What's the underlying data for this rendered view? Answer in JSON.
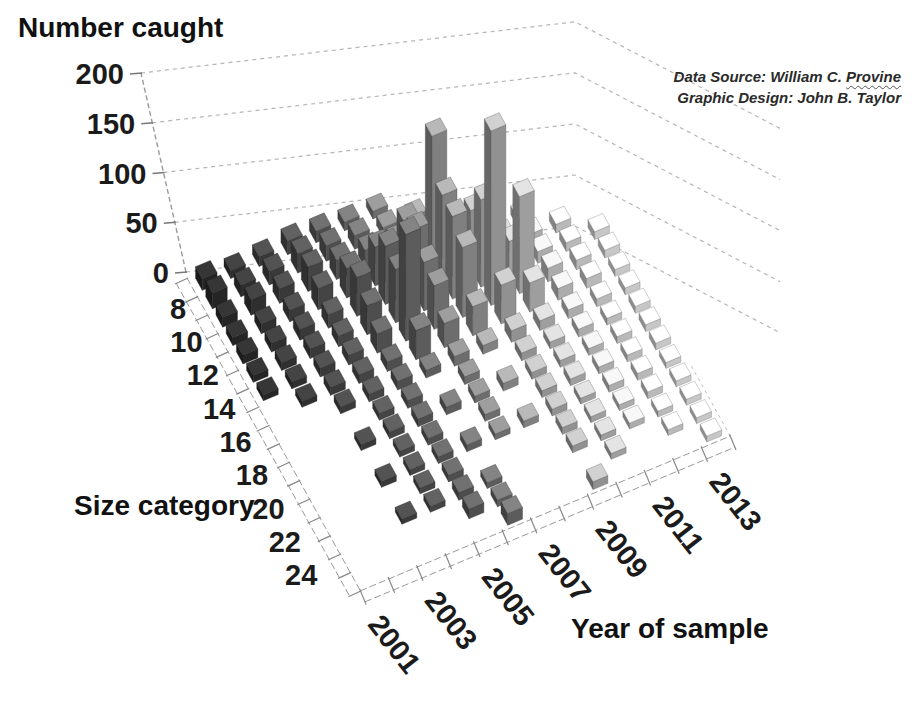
{
  "credits": {
    "data_source_prefix": "Data Source: William C. ",
    "data_source_name": "Provine",
    "graphic_design": "Graphic Design:  John B. Taylor"
  },
  "chart_data": {
    "type": "bar",
    "variant": "3d-column",
    "title": "",
    "value_axis": {
      "title": "Number caught",
      "min": 0,
      "max": 200,
      "tick_step": 50,
      "ticks": [
        0,
        50,
        100,
        150,
        200
      ]
    },
    "size_axis": {
      "title": "Size category",
      "categories": [
        8,
        9,
        10,
        11,
        12,
        13,
        14,
        15,
        16,
        17,
        18,
        19,
        20,
        21,
        22,
        23,
        24
      ],
      "labeled_ticks": [
        8,
        10,
        12,
        14,
        16,
        18,
        20,
        22,
        24
      ]
    },
    "year_axis": {
      "title": "Year of sample",
      "categories": [
        2001,
        2002,
        2003,
        2004,
        2005,
        2006,
        2007,
        2008,
        2009,
        2010,
        2011,
        2012,
        2013
      ],
      "labeled_ticks": [
        2001,
        2003,
        2005,
        2007,
        2009,
        2011,
        2013
      ]
    },
    "legend": "none",
    "grid": "dashed-backwall",
    "series": [
      {
        "size": 8,
        "values": [
          12,
          8,
          10,
          14,
          12,
          9,
          8,
          0,
          0,
          0,
          0,
          0,
          0
        ]
      },
      {
        "size": 9,
        "values": [
          16,
          12,
          14,
          20,
          16,
          14,
          10,
          9,
          0,
          0,
          0,
          0,
          0
        ]
      },
      {
        "size": 10,
        "values": [
          10,
          16,
          15,
          25,
          20,
          18,
          15,
          12,
          10,
          0,
          0,
          0,
          0
        ]
      },
      {
        "size": 11,
        "values": [
          8,
          10,
          12,
          22,
          30,
          40,
          55,
          130,
          28,
          12,
          9,
          0,
          0
        ]
      },
      {
        "size": 12,
        "values": [
          9,
          9,
          11,
          14,
          40,
          60,
          65,
          88,
          60,
          20,
          10,
          9,
          0
        ]
      },
      {
        "size": 13,
        "values": [
          7,
          8,
          10,
          11,
          30,
          55,
          50,
          85,
          90,
          35,
          12,
          9,
          8
        ]
      },
      {
        "size": 14,
        "values": [
          6,
          7,
          9,
          10,
          20,
          110,
          45,
          72,
          180,
          100,
          14,
          10,
          8
        ]
      },
      {
        "size": 15,
        "values": [
          0,
          6,
          8,
          9,
          10,
          30,
          25,
          30,
          40,
          30,
          12,
          10,
          7
        ]
      },
      {
        "size": 16,
        "values": [
          0,
          0,
          7,
          8,
          9,
          8,
          10,
          9,
          12,
          10,
          9,
          8,
          7
        ]
      },
      {
        "size": 17,
        "values": [
          0,
          0,
          0,
          7,
          8,
          0,
          8,
          0,
          8,
          7,
          8,
          7,
          7
        ]
      },
      {
        "size": 18,
        "values": [
          0,
          0,
          6,
          7,
          8,
          8,
          7,
          8,
          7,
          7,
          7,
          7,
          7
        ]
      },
      {
        "size": 19,
        "values": [
          0,
          0,
          0,
          6,
          7,
          0,
          7,
          0,
          7,
          7,
          7,
          7,
          7
        ]
      },
      {
        "size": 20,
        "values": [
          0,
          0,
          6,
          6,
          7,
          7,
          6,
          7,
          7,
          6,
          7,
          7,
          6
        ]
      },
      {
        "size": 21,
        "values": [
          0,
          0,
          0,
          6,
          7,
          0,
          0,
          0,
          7,
          6,
          6,
          7,
          6
        ]
      },
      {
        "size": 22,
        "values": [
          0,
          0,
          5,
          6,
          8,
          6,
          0,
          0,
          7,
          6,
          6,
          6,
          6
        ]
      },
      {
        "size": 23,
        "values": [
          0,
          0,
          0,
          0,
          10,
          7,
          0,
          0,
          0,
          6,
          0,
          6,
          6
        ]
      },
      {
        "size": 24,
        "values": [
          0,
          0,
          0,
          0,
          0,
          12,
          0,
          0,
          8,
          0,
          0,
          0,
          6
        ]
      }
    ],
    "colors": {
      "background": "#ffffff",
      "gridline": "#b6b6b6",
      "axis_line": "#9a9a9a",
      "tick_text": "#1b1b1b",
      "year_shades": [
        "#242424",
        "#2d2d2d",
        "#373737",
        "#414141",
        "#4b4b4b",
        "#585858",
        "#696969",
        "#7b7b7b",
        "#8b8b8b",
        "#989898",
        "#a5a5a5",
        "#b2b2b2",
        "#bfbfbf"
      ]
    }
  }
}
